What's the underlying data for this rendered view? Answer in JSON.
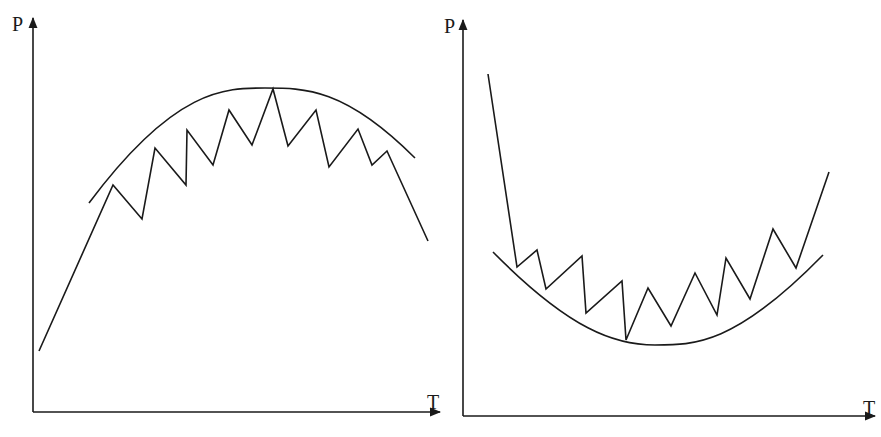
{
  "figure": {
    "background": "#ffffff",
    "stroke_color": "#1a1a1a",
    "panels": [
      {
        "id": "left",
        "y_axis_label": "P",
        "x_axis_label": "T",
        "y_label_pos": [
          12,
          14
        ],
        "x_label_pos": [
          427,
          392
        ]
      },
      {
        "id": "right",
        "y_axis_label": "P",
        "x_axis_label": "T",
        "y_label_pos": [
          444,
          16
        ],
        "x_label_pos": [
          863,
          398
        ]
      }
    ]
  },
  "chart_data": [
    {
      "type": "line",
      "title": "",
      "xlabel": "T",
      "ylabel": "P",
      "grid": false,
      "description": "Zigzag trajectory rising then falling beneath a concave-down envelope curve (maximum)",
      "axes_px": {
        "origin": [
          33,
          412
        ],
        "y_top": [
          33,
          18
        ],
        "x_right": [
          440,
          412
        ]
      },
      "series": [
        {
          "name": "zigzag",
          "points_px": [
            [
              39,
              351
            ],
            [
              113,
              185
            ],
            [
              142,
              219
            ],
            [
              155,
              148
            ],
            [
              186,
              185
            ],
            [
              187,
              130
            ],
            [
              213,
              165
            ],
            [
              229,
              110
            ],
            [
              252,
              145
            ],
            [
              273,
              89
            ],
            [
              288,
              146
            ],
            [
              316,
              110
            ],
            [
              329,
              167
            ],
            [
              358,
              129
            ],
            [
              372,
              165
            ],
            [
              387,
              151
            ],
            [
              428,
              241
            ]
          ]
        },
        {
          "name": "envelope",
          "curve_px": {
            "start": [
              89,
              203
            ],
            "control": [
              175,
              88
            ],
            "apex": [
              265,
              88
            ],
            "control2": [
              345,
              88
            ],
            "end": [
              415,
              158
            ]
          }
        }
      ]
    },
    {
      "type": "line",
      "title": "",
      "xlabel": "T",
      "ylabel": "P",
      "grid": false,
      "description": "Zigzag trajectory falling then rising above a concave-up envelope curve (minimum)",
      "axes_px": {
        "origin": [
          463,
          416
        ],
        "y_top": [
          463,
          20
        ],
        "x_right": [
          875,
          416
        ]
      },
      "series": [
        {
          "name": "zigzag",
          "points_px": [
            [
              488,
              74
            ],
            [
              517,
              267
            ],
            [
              537,
              250
            ],
            [
              546,
              289
            ],
            [
              582,
              256
            ],
            [
              586,
              313
            ],
            [
              622,
              281
            ],
            [
              626,
              340
            ],
            [
              648,
              288
            ],
            [
              671,
              326
            ],
            [
              695,
              273
            ],
            [
              717,
              315
            ],
            [
              726,
              258
            ],
            [
              750,
              299
            ],
            [
              773,
              229
            ],
            [
              796,
              268
            ],
            [
              829,
              172
            ]
          ]
        },
        {
          "name": "envelope",
          "curve_px": {
            "start": [
              493,
              252
            ],
            "control": [
              570,
              330
            ],
            "apex": [
              655,
              345
            ],
            "control2": [
              735,
              345
            ],
            "end": [
              823,
              255
            ]
          }
        }
      ]
    }
  ]
}
